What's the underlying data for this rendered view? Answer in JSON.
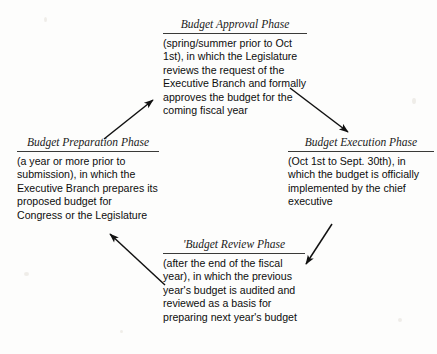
{
  "diagram": {
    "type": "cycle",
    "phases": [
      {
        "id": "preparation",
        "heading": "Budget Preparation Phase",
        "body": "(a year or more prior to submission), in which the Executive Branch prepares its proposed budget for Congress or the Legislature",
        "position": "left"
      },
      {
        "id": "approval",
        "heading": "Budget Approval Phase",
        "body": "(spring/summer prior to Oct 1st), in which the Legislature reviews the request of the Executive Branch and formally approves the budget for the coming fiscal year",
        "position": "top"
      },
      {
        "id": "execution",
        "heading": "Budget Execution Phase",
        "body": "(Oct 1st to Sept. 30th), in which the budget is officially implemented by the chief executive",
        "position": "right"
      },
      {
        "id": "review",
        "heading": "'Budget Review Phase",
        "body": "(after the end of the fiscal year), in which the previous year's budget is audited and reviewed as a basis for preparing next year's budget",
        "position": "bottom"
      }
    ],
    "arrows": [
      {
        "id": "preparation-to-approval",
        "from": "preparation",
        "to": "approval",
        "direction": "up-right"
      },
      {
        "id": "approval-to-execution",
        "from": "approval",
        "to": "execution",
        "direction": "down-right"
      },
      {
        "id": "execution-to-review",
        "from": "execution",
        "to": "review",
        "direction": "down-left"
      },
      {
        "id": "review-to-preparation",
        "from": "review",
        "to": "preparation",
        "direction": "up-left"
      }
    ],
    "colors": {
      "background": "#fdfdfc",
      "text": "#0d0d0d",
      "rule": "#3a3a38",
      "arrow": "#111111"
    }
  }
}
